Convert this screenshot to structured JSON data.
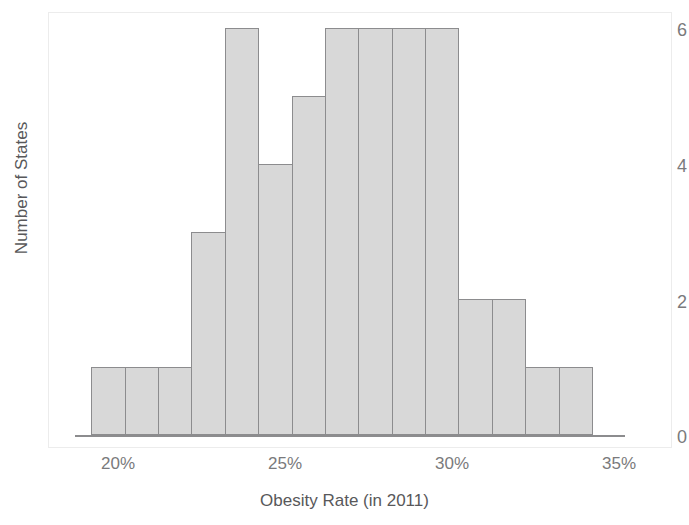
{
  "chart_data": {
    "type": "bar",
    "title": "",
    "subtitle": "",
    "xlabel": "Obesity Rate (in 2011)",
    "ylabel": "Number of States",
    "categories": [
      "20%",
      "21%",
      "22%",
      "23%",
      "24%",
      "25%",
      "26%",
      "27%",
      "28%",
      "29%",
      "30%",
      "31%",
      "32%",
      "33%",
      "34%"
    ],
    "bin_starts": [
      20,
      21,
      22,
      23,
      24,
      25,
      26,
      27,
      28,
      29,
      30,
      31,
      32,
      33,
      34
    ],
    "bin_width": 1,
    "values": [
      1,
      1,
      1,
      3,
      6,
      4,
      5,
      6,
      6,
      6,
      6,
      2,
      2,
      1,
      1
    ],
    "xlim": [
      18.8,
      36.6
    ],
    "ylim": [
      0,
      6.1
    ],
    "x_tick_labels": [
      "20%",
      "25%",
      "30%",
      "35%"
    ],
    "x_tick_values": [
      20,
      25,
      30,
      35
    ],
    "y_tick_labels": [
      "0",
      "2",
      "4",
      "6"
    ],
    "y_tick_values": [
      0,
      2,
      4,
      6
    ],
    "grid": false,
    "legend": null,
    "legend_position": "none",
    "bar_fill_color": "#d8d8d8",
    "bar_edge_color": "#8c8c8e",
    "axis_color": "#8c8c8e",
    "text_color": "#58585a",
    "tick_text_color": "#7a7a7c"
  }
}
